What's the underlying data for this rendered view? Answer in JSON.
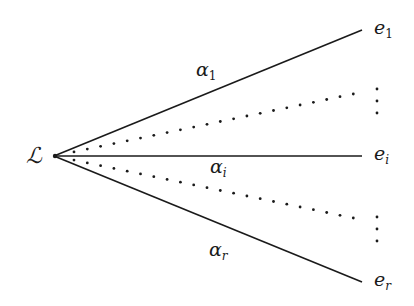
{
  "diagram": {
    "type": "fan-diagram",
    "source": {
      "label": "ℒ",
      "x": 54,
      "y": 156
    },
    "solid_edges": [
      {
        "id": "top",
        "label_main": "α",
        "label_sub": "1",
        "target_main": "e",
        "target_sub": "1",
        "x2": 362,
        "y2": 30
      },
      {
        "id": "middle",
        "label_main": "α",
        "label_sub": "i",
        "target_main": "e",
        "target_sub": "i",
        "x2": 362,
        "y2": 156
      },
      {
        "id": "bottom",
        "label_main": "α",
        "label_sub": "r",
        "target_main": "e",
        "target_sub": "r",
        "x2": 362,
        "y2": 282
      }
    ],
    "dotted_edges": [
      {
        "id": "upper-dotted",
        "x2": 353,
        "y2": 94
      },
      {
        "id": "lower-dotted",
        "x2": 353,
        "y2": 218
      }
    ],
    "vertical_ellipses": [
      {
        "id": "upper-vdots",
        "x": 377,
        "ys": [
          89,
          101,
          113
        ]
      },
      {
        "id": "lower-vdots",
        "x": 377,
        "ys": [
          217,
          229,
          241
        ]
      }
    ],
    "colors": {
      "ink": "#1a1a1a",
      "background": "#ffffff"
    }
  }
}
